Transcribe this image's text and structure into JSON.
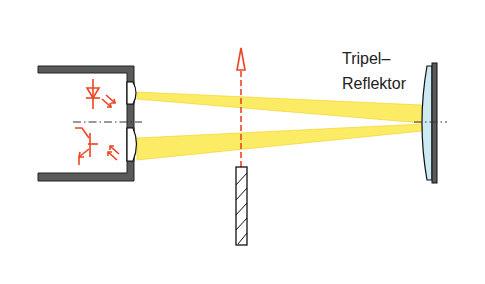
{
  "diagram": {
    "labels": {
      "reflector_line1": "Tripel–",
      "reflector_line2": "Reflektor"
    },
    "components": [
      {
        "id": "housing",
        "description": "sensor housing with emitter (LED) and receiver (phototransistor)"
      },
      {
        "id": "led",
        "symbol": "light-emitting diode"
      },
      {
        "id": "phototransistor",
        "symbol": "phototransistor"
      },
      {
        "id": "lenses",
        "count": 2
      },
      {
        "id": "light-beams",
        "count": 2
      },
      {
        "id": "movement-arrow",
        "direction": "up"
      },
      {
        "id": "object",
        "style": "hatched bar"
      },
      {
        "id": "triple-reflector"
      }
    ],
    "colors": {
      "housing": "#555555",
      "housing_stroke": "#222222",
      "symbol_red": "#ee4422",
      "beam_fill": "#fbe94a",
      "beam_stroke": "#f2cf1e",
      "reflector_lens": "#cde9f4",
      "axis": "#333333"
    }
  }
}
